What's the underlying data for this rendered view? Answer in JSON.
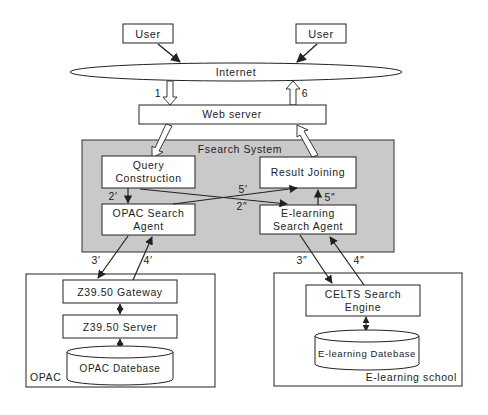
{
  "diagram": {
    "nodes": {
      "user_left": "User",
      "user_right": "User",
      "internet": "Internet",
      "web_server": "Web server",
      "fsearch_system": "Fsearch System",
      "query_construction": [
        "Query",
        "Construction"
      ],
      "result_joining": "Result Joining",
      "opac_search_agent": [
        "OPAC Search",
        "Agent"
      ],
      "elearning_search_agent": [
        "E-learning",
        "Search Agent"
      ],
      "z3950_gateway": "Z39.50 Gateway",
      "z3950_server": "Z39.50 Server",
      "opac_database": "OPAC Datebase",
      "opac_group": "OPAC",
      "celts_search_engine": [
        "CELTS Search",
        "Engine"
      ],
      "elearning_database": "E-learning Datebase",
      "elearning_school_group": "E-learning school"
    },
    "edges": {
      "e1": "1",
      "e6": "6",
      "e2p": "2′",
      "e2pp": "2″",
      "e5p": "5′",
      "e5pp": "5″",
      "e3p": "3′",
      "e4p": "4′",
      "e3pp": "3″",
      "e4pp": "4″"
    },
    "colors": {
      "system_fill": "#c9c9c9",
      "line": "#222222",
      "box_fill": "#ffffff"
    }
  }
}
